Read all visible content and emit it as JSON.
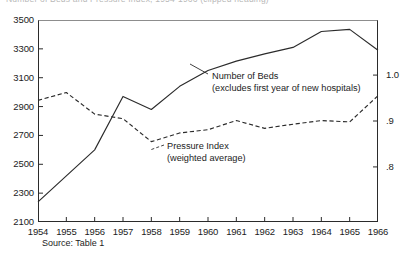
{
  "title": {
    "text": "Number of Beds and Pressure Index, 1954-1966 (clipped heading)"
  },
  "source": {
    "label": "Source: Table 1"
  },
  "annotations": {
    "beds_line1": "Number of Beds",
    "beds_line2": "(excludes first year of new hospitals)",
    "pressure_line1": "Pressure Index",
    "pressure_line2": "(weighted average)"
  },
  "colors": {
    "ink": "#1c1c1c",
    "axis": "#2b2b2b",
    "series_beds": "#2b2b2b",
    "series_pressure": "#2b2b2b",
    "background": "#ffffff"
  },
  "chart_data": {
    "type": "line",
    "title": "",
    "xlabel": "",
    "ylabel": "",
    "grid": false,
    "legend_position": "inline-annotation",
    "x": [
      1954,
      1955,
      1956,
      1957,
      1958,
      1959,
      1960,
      1961,
      1962,
      1963,
      1964,
      1965,
      1966
    ],
    "categories": [
      "1954",
      "1955",
      "1956",
      "1957",
      "1958",
      "1959",
      "1960",
      "1961",
      "1962",
      "1963",
      "1964",
      "1965",
      "1966"
    ],
    "xtick_labels": [
      "1954",
      "1955",
      "1956",
      "1957",
      "1958",
      "1959",
      "1960",
      "1961",
      "1962",
      "1963",
      "1964",
      "1965",
      "1966"
    ],
    "axes": {
      "left": {
        "label": "",
        "ylim": [
          2100,
          3500
        ],
        "ticks": [
          2100,
          2300,
          2500,
          2700,
          2900,
          3100,
          3300,
          3500
        ],
        "tick_labels": [
          "2100",
          "2300",
          "2500",
          "2700",
          "2900",
          "3100",
          "3300",
          "3500"
        ]
      },
      "right": {
        "label": "",
        "ylim": [
          0.68,
          1.12
        ],
        "ticks": [
          0.8,
          0.9,
          1.0
        ],
        "tick_labels": [
          ".8",
          ".9",
          "1.0"
        ]
      }
    },
    "series": [
      {
        "name": "Number of Beds",
        "note": "excludes first year of new hospitals",
        "axis": "left",
        "style": "solid",
        "values": [
          2240,
          2420,
          2600,
          2970,
          2880,
          3040,
          3150,
          3215,
          3265,
          3310,
          3420,
          3435,
          3290
        ]
      },
      {
        "name": "Pressure Index",
        "note": "weighted average",
        "axis": "right",
        "style": "dashed",
        "values": [
          0.945,
          0.962,
          0.915,
          0.905,
          0.855,
          0.874,
          0.881,
          0.901,
          0.884,
          0.893,
          0.901,
          0.898,
          0.955
        ]
      }
    ]
  }
}
